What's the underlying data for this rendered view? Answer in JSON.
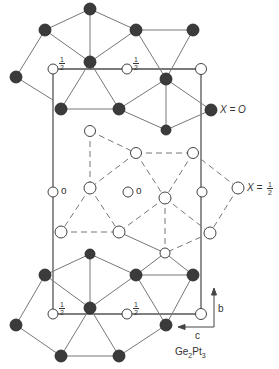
{
  "diagram": {
    "title": "Ge2Pt3",
    "formula": {
      "el1": "Ge",
      "sub1": "2",
      "el2": "Pt",
      "sub2": "3"
    },
    "axes": {
      "vertical": "b",
      "horizontal": "c"
    },
    "layer_labels": {
      "x0": "X = O",
      "x_half_prefix": "X =",
      "x_half_num": "1",
      "x_half_den": "2"
    },
    "height_labels": {
      "half_num": "1",
      "half_den": "2",
      "zero": "o"
    },
    "colors": {
      "dark_atom": "#3a3a3a",
      "line": "#666666",
      "open_atom_fill": "#ffffff"
    }
  }
}
